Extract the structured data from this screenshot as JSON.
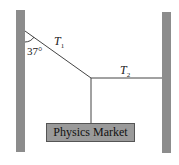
{
  "diagram": {
    "labels": {
      "t1": {
        "main": "T",
        "sub": "1"
      },
      "t2": {
        "main": "T",
        "sub": "2"
      },
      "angle": "37°"
    },
    "mass_label": "Physics Market",
    "colors": {
      "wall": "#8c8c8c",
      "rope": "#444444",
      "box": "#9a9a9a"
    }
  }
}
